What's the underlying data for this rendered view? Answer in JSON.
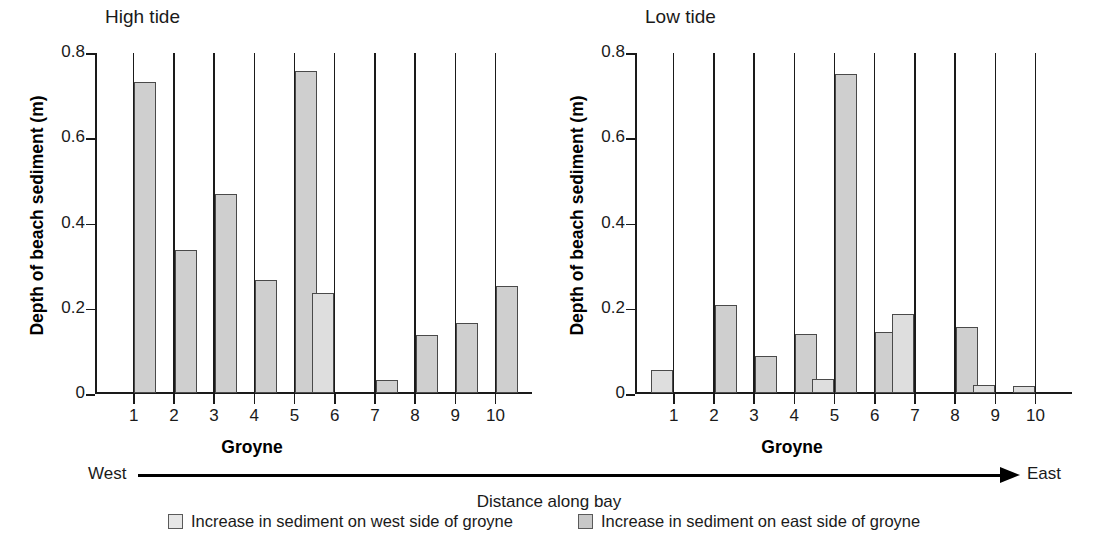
{
  "figure": {
    "xaxis_caption": "Distance along bay",
    "direction_left_label": "West",
    "direction_right_label": "East"
  },
  "legend": {
    "west": {
      "label": "Increase in sediment on west side of groyne",
      "color": "#e6e6e6"
    },
    "east": {
      "label": "Increase in sediment on east side of groyne",
      "color": "#c8c8c8"
    }
  },
  "panels": {
    "high": {
      "title": "High tide",
      "ylabel": "Depth of beach sediment (m)",
      "xlabel": "Groyne"
    },
    "low": {
      "title": "Low tide",
      "ylabel": "Depth of beach sediment (m)",
      "xlabel": "Groyne"
    }
  },
  "axis": {
    "yticks": [
      "0",
      "0.2",
      "0.4",
      "0.6",
      "0.8"
    ],
    "ytick_values": [
      0,
      0.2,
      0.4,
      0.6,
      0.8
    ],
    "xticks": [
      "1",
      "2",
      "3",
      "4",
      "5",
      "6",
      "7",
      "8",
      "9",
      "10"
    ]
  },
  "chart_data": [
    {
      "type": "bar",
      "title": "High tide",
      "xlabel": "Groyne",
      "ylabel": "Depth of beach sediment (m)",
      "categories": [
        "1",
        "2",
        "3",
        "4",
        "5",
        "6",
        "7",
        "8",
        "9",
        "10"
      ],
      "ylim": [
        0,
        0.8
      ],
      "yticks": [
        0,
        0.2,
        0.4,
        0.6,
        0.8
      ],
      "grid": false,
      "legend_position": "below-figure",
      "series": [
        {
          "name": "Increase in sediment on west side of groyne",
          "values": [
            0,
            0,
            0,
            0,
            0,
            0.235,
            0,
            0,
            0,
            0
          ]
        },
        {
          "name": "Increase in sediment on east side of groyne",
          "values": [
            0.73,
            0.335,
            0.468,
            0.265,
            0.755,
            0,
            0.03,
            0.135,
            0.165,
            0.25
          ]
        }
      ]
    },
    {
      "type": "bar",
      "title": "Low tide",
      "xlabel": "Groyne",
      "ylabel": "Depth of beach sediment (m)",
      "categories": [
        "1",
        "2",
        "3",
        "4",
        "5",
        "6",
        "7",
        "8",
        "9",
        "10"
      ],
      "ylim": [
        0,
        0.8
      ],
      "yticks": [
        0,
        0.2,
        0.4,
        0.6,
        0.8
      ],
      "grid": false,
      "legend_position": "below-figure",
      "series": [
        {
          "name": "Increase in sediment on west side of groyne",
          "values": [
            0.055,
            0,
            0,
            0,
            0.033,
            0,
            0.185,
            0,
            0.018,
            0.016
          ]
        },
        {
          "name": "Increase in sediment on east side of groyne",
          "values": [
            0,
            0.207,
            0.088,
            0.138,
            0.748,
            0.143,
            0,
            0.155,
            0,
            0
          ]
        }
      ]
    }
  ]
}
